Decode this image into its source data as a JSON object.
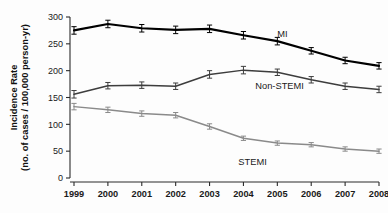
{
  "chart_data": {
    "type": "line",
    "title": "",
    "xlabel": "",
    "ylabel": "Incidence Rate (no. of cases / 100,000 person-yr)",
    "ylabel_line1": "Incidence Rate",
    "ylabel_line2": "(no. of cases / 100,000 person-yr)",
    "categories": [
      "1999",
      "2000",
      "2001",
      "2002",
      "2003",
      "2004",
      "2005",
      "2006",
      "2007",
      "2008"
    ],
    "x": [
      1999,
      2000,
      2001,
      2002,
      2003,
      2004,
      2005,
      2006,
      2007,
      2008
    ],
    "ylim": [
      0,
      300
    ],
    "yticks": [
      0,
      50,
      100,
      150,
      200,
      250,
      300
    ],
    "ytick_labels": [
      "0",
      "50",
      "100",
      "150",
      "200",
      "250",
      "300"
    ],
    "grid": false,
    "legend_position": "inline-annotations",
    "error_bars": true,
    "series": [
      {
        "name": "MI",
        "color": "#000000",
        "line_width": 2.2,
        "values": [
          275,
          287,
          279,
          276,
          278,
          266,
          255,
          237,
          219,
          209
        ],
        "errors": [
          7,
          7,
          7,
          7,
          7,
          7,
          7,
          6,
          6,
          6
        ],
        "label_x": 2005.0,
        "label_y": 268
      },
      {
        "name": "Non-STEMI",
        "color": "#3d3d3d",
        "line_width": 1.5,
        "values": [
          156,
          172,
          173,
          171,
          193,
          201,
          197,
          183,
          171,
          165
        ],
        "errors": [
          7,
          6,
          6,
          6,
          7,
          7,
          6,
          6,
          6,
          6
        ],
        "label_x": 2004.35,
        "label_y": 172
      },
      {
        "name": "STEMI",
        "color": "#8a8a8a",
        "line_width": 1.5,
        "values": [
          133,
          127,
          120,
          117,
          96,
          74,
          65,
          62,
          54,
          50
        ],
        "errors": [
          6,
          5,
          5,
          5,
          5,
          4,
          4,
          4,
          4,
          4
        ],
        "label_x": 2003.85,
        "label_y": 30
      }
    ]
  }
}
